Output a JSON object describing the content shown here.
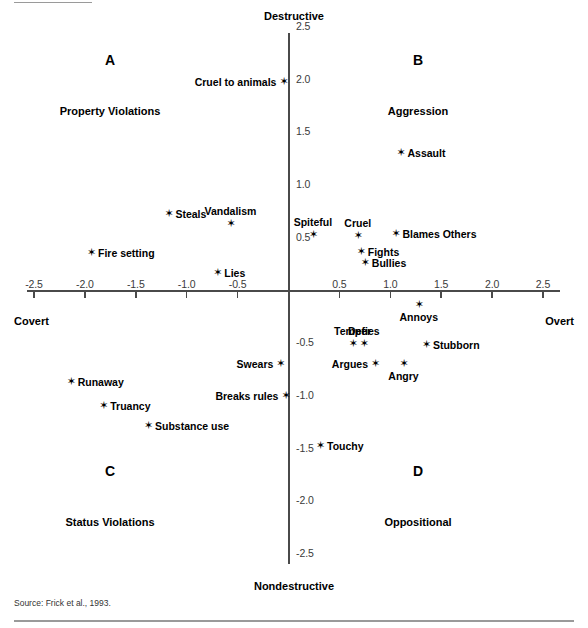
{
  "figure": {
    "source_note": "Source: Frick et al., 1993.",
    "marker_glyph": "✶"
  },
  "axes": {
    "y_pole_top": "Destructive",
    "y_pole_bottom": "Nondestructive",
    "x_pole_left": "Covert",
    "x_pole_right": "Overt",
    "x_ticks": [
      "-2.5",
      "-2.0",
      "-1.5",
      "-1.0",
      "-0.5",
      "0.5",
      "1.0",
      "1.5",
      "2.0",
      "2.5"
    ],
    "y_ticks": [
      "2.5",
      "2.0",
      "1.5",
      "1.0",
      "0.5",
      "-0.5",
      "-1.0",
      "-1.5",
      "-2.0",
      "-2.5"
    ]
  },
  "quadrants": [
    {
      "letter": "A",
      "name": "Property Violations"
    },
    {
      "letter": "B",
      "name": "Aggression"
    },
    {
      "letter": "C",
      "name": "Status Violations"
    },
    {
      "letter": "D",
      "name": "Oppositional"
    }
  ],
  "chart_data": {
    "type": "scatter",
    "title": "",
    "xlabel": "Covert – Overt",
    "ylabel": "Nondestructive – Destructive",
    "xlim": [
      -2.5,
      2.5
    ],
    "ylim": [
      -2.5,
      2.5
    ],
    "grid": false,
    "legend": "none",
    "quadrant_annotations": [
      {
        "quadrant": "A",
        "label": "Property Violations",
        "region": "upper-left"
      },
      {
        "quadrant": "B",
        "label": "Aggression",
        "region": "upper-right"
      },
      {
        "quadrant": "C",
        "label": "Status Violations",
        "region": "lower-left"
      },
      {
        "quadrant": "D",
        "label": "Oppositional",
        "region": "lower-right"
      }
    ],
    "points": [
      {
        "label": "Cruel to animals",
        "x": -0.05,
        "y": 1.98,
        "label_pos": "left"
      },
      {
        "label": "Assault",
        "x": 1.1,
        "y": 1.3,
        "label_pos": "right"
      },
      {
        "label": "Steals",
        "x": -1.18,
        "y": 0.73,
        "label_pos": "right"
      },
      {
        "label": "Vandalism",
        "x": -0.57,
        "y": 0.63,
        "label_pos": "above"
      },
      {
        "label": "Spiteful",
        "x": 0.24,
        "y": 0.53,
        "label_pos": "above"
      },
      {
        "label": "Cruel",
        "x": 0.68,
        "y": 0.52,
        "label_pos": "above"
      },
      {
        "label": "Blames Others",
        "x": 1.05,
        "y": 0.54,
        "label_pos": "right"
      },
      {
        "label": "Fights",
        "x": 0.71,
        "y": 0.37,
        "label_pos": "right"
      },
      {
        "label": "Bullies",
        "x": 0.75,
        "y": 0.26,
        "label_pos": "right"
      },
      {
        "label": "Fire setting",
        "x": -1.94,
        "y": 0.36,
        "label_pos": "right"
      },
      {
        "label": "Lies",
        "x": -0.7,
        "y": 0.17,
        "label_pos": "right"
      },
      {
        "label": "Annoys",
        "x": 1.28,
        "y": -0.14,
        "label_pos": "below"
      },
      {
        "label": "Temper",
        "x": 0.63,
        "y": -0.51,
        "label_pos": "above"
      },
      {
        "label": "Defies",
        "x": 0.74,
        "y": -0.51,
        "label_pos": "above"
      },
      {
        "label": "Stubborn",
        "x": 1.35,
        "y": -0.52,
        "label_pos": "right"
      },
      {
        "label": "Argues",
        "x": 0.85,
        "y": -0.7,
        "label_pos": "left"
      },
      {
        "label": "Angry",
        "x": 1.13,
        "y": -0.7,
        "label_pos": "below"
      },
      {
        "label": "Swears",
        "x": -0.08,
        "y": -0.7,
        "label_pos": "left"
      },
      {
        "label": "Runaway",
        "x": -2.14,
        "y": -0.87,
        "label_pos": "right"
      },
      {
        "label": "Breaks rules",
        "x": -0.03,
        "y": -1.0,
        "label_pos": "left"
      },
      {
        "label": "Truancy",
        "x": -1.82,
        "y": -1.1,
        "label_pos": "right"
      },
      {
        "label": "Substance use",
        "x": -1.38,
        "y": -1.29,
        "label_pos": "right"
      },
      {
        "label": "Touchy",
        "x": 0.31,
        "y": -1.48,
        "label_pos": "right"
      }
    ]
  }
}
